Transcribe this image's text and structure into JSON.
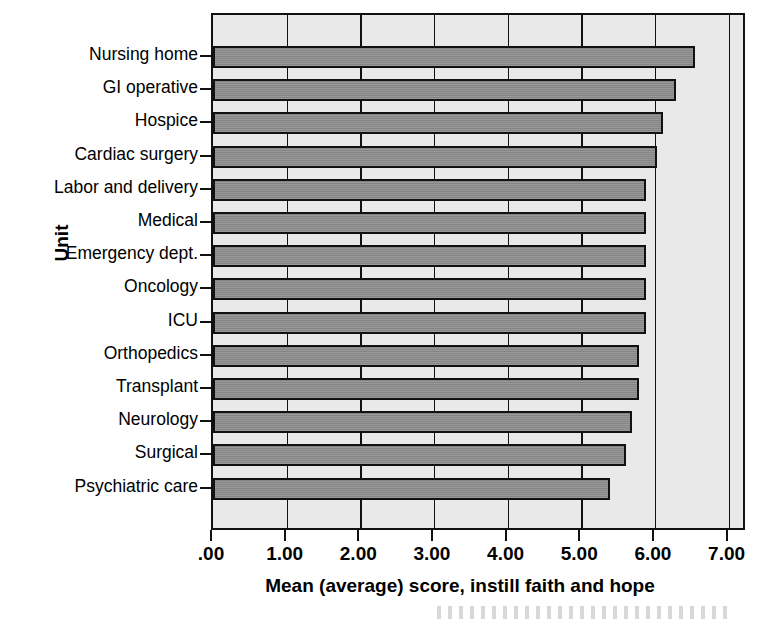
{
  "chart_data": {
    "type": "bar",
    "orientation": "horizontal",
    "title": "",
    "xlabel": "Mean (average) score, instill faith and hope",
    "ylabel": "Unit",
    "xlim": [
      0,
      7.25
    ],
    "xticks": [
      0,
      1,
      2,
      3,
      4,
      5,
      6,
      7
    ],
    "xtick_labels": [
      ".00",
      "1.00",
      "2.00",
      "3.00",
      "4.00",
      "5.00",
      "6.00",
      "7.00"
    ],
    "grid": true,
    "grid_axis": "x",
    "legend": false,
    "categories": [
      "Nursing home",
      "GI operative",
      "Hospice",
      "Cardiac surgery",
      "Labor and delivery",
      "Medical",
      "Emergency dept.",
      "Oncology",
      "ICU",
      "Orthopedics",
      "Transplant",
      "Neurology",
      "Surgical",
      "Psychiatric care"
    ],
    "values": [
      6.55,
      6.29,
      6.11,
      6.03,
      5.88,
      5.88,
      5.88,
      5.88,
      5.88,
      5.79,
      5.79,
      5.69,
      5.61,
      5.39
    ],
    "colors": {
      "bar_fill": "#8d8d8d",
      "bar_edge": "#111111",
      "plot_background": "#e9e9e9",
      "axis": "#111111",
      "text": "#000000",
      "figure_background": "#ffffff"
    }
  }
}
